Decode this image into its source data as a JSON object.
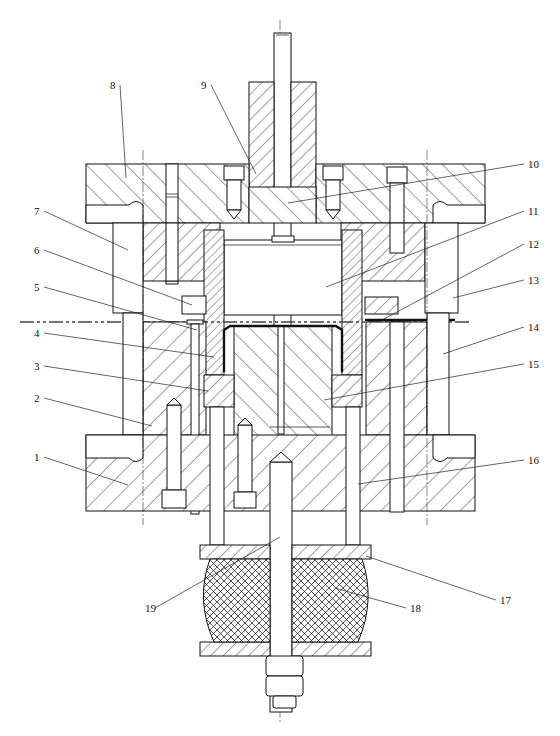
{
  "figure": {
    "type": "engineering cross-section drawing",
    "line_color": "#111111",
    "background": "#ffffff"
  },
  "callouts": [
    {
      "id": "1",
      "label": "1",
      "x": 34,
      "y": 461,
      "tx": 128,
      "ty": 485
    },
    {
      "id": "2",
      "label": "2",
      "x": 34,
      "y": 402,
      "tx": 152,
      "ty": 426
    },
    {
      "id": "3",
      "label": "3",
      "x": 34,
      "y": 370,
      "tx": 208,
      "ty": 391
    },
    {
      "id": "4",
      "label": "4",
      "x": 34,
      "y": 337,
      "tx": 214,
      "ty": 357
    },
    {
      "id": "5",
      "label": "5",
      "x": 34,
      "y": 291,
      "tx": 197,
      "ty": 330
    },
    {
      "id": "6",
      "label": "6",
      "x": 34,
      "y": 254,
      "tx": 192,
      "ty": 305
    },
    {
      "id": "7",
      "label": "7",
      "x": 34,
      "y": 215,
      "tx": 128,
      "ty": 250
    },
    {
      "id": "8",
      "label": "8",
      "x": 110,
      "y": 89,
      "tx": 126,
      "ty": 178
    },
    {
      "id": "9",
      "label": "9",
      "x": 201,
      "y": 89,
      "tx": 256,
      "ty": 174
    },
    {
      "id": "10",
      "label": "10",
      "x": 528,
      "y": 168,
      "tx": 288,
      "ty": 203
    },
    {
      "id": "11",
      "label": "11",
      "x": 528,
      "y": 215,
      "tx": 326,
      "ty": 287
    },
    {
      "id": "12",
      "label": "12",
      "x": 528,
      "y": 248,
      "tx": 382,
      "ty": 320
    },
    {
      "id": "13",
      "label": "13",
      "x": 528,
      "y": 284,
      "tx": 453,
      "ty": 298
    },
    {
      "id": "14",
      "label": "14",
      "x": 528,
      "y": 331,
      "tx": 443,
      "ty": 354
    },
    {
      "id": "15",
      "label": "15",
      "x": 528,
      "y": 368,
      "tx": 324,
      "ty": 400
    },
    {
      "id": "16",
      "label": "16",
      "x": 528,
      "y": 464,
      "tx": 358,
      "ty": 484
    },
    {
      "id": "17",
      "label": "17",
      "x": 500,
      "y": 604,
      "tx": 366,
      "ty": 556
    },
    {
      "id": "18",
      "label": "18",
      "x": 410,
      "y": 612,
      "tx": 335,
      "ty": 588
    },
    {
      "id": "19",
      "label": "19",
      "x": 145,
      "y": 612,
      "tx": 280,
      "ty": 537
    }
  ],
  "parts": {
    "1": "lower die base plate",
    "2": "lower fixed plate",
    "3": "blank holder ring",
    "4": "die (concave)",
    "5": "stop pin",
    "6": "stopper block (left)",
    "7": "upper fixed plate",
    "8": "upper die base plate",
    "9": "die shank",
    "10": "ejector rod",
    "11": "ejector block",
    "12": "stopper block (right)",
    "13": "guide sleeve",
    "14": "guide post",
    "15": "punch",
    "16": "push rod",
    "17": "cushion plate",
    "18": "rubber cushion",
    "19": "stud bolt"
  }
}
